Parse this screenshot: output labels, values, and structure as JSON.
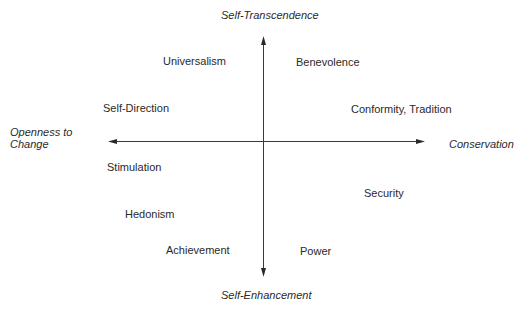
{
  "diagram": {
    "axes": {
      "top": "Self-Transcendence",
      "bottom": "Self-Enhancement",
      "left_line1": "Openness to",
      "left_line2": "Change",
      "right": "Conservation"
    },
    "values": [
      {
        "label": "Universalism",
        "quadrant": "top-left"
      },
      {
        "label": "Benevolence",
        "quadrant": "top-right"
      },
      {
        "label": "Self-Direction",
        "quadrant": "top-left"
      },
      {
        "label": "Conformity, Tradition",
        "quadrant": "top-right"
      },
      {
        "label": "Stimulation",
        "quadrant": "bottom-left"
      },
      {
        "label": "Security",
        "quadrant": "bottom-right"
      },
      {
        "label": "Hedonism",
        "quadrant": "bottom-left"
      },
      {
        "label": "Achievement",
        "quadrant": "bottom-left"
      },
      {
        "label": "Power",
        "quadrant": "bottom-right"
      }
    ],
    "colors": {
      "line": "#3a3a3a",
      "text": "#2a2a2a"
    }
  }
}
